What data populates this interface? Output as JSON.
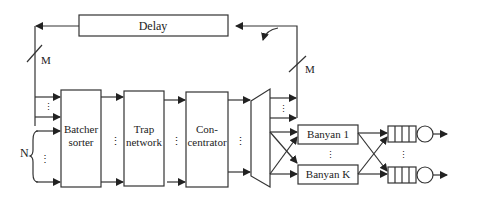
{
  "diagram": {
    "blocks": {
      "delay": "Delay",
      "batcher_line1": "Batcher",
      "batcher_line2": "sorter",
      "trap_line1": "Trap",
      "trap_line2": "network",
      "concentrator_line1": "Con-",
      "concentrator_line2": "centrator",
      "banyan_first": "Banyan 1",
      "banyan_last": "Banyan K"
    },
    "labels": {
      "feedback_width_left": "M",
      "feedback_width_right": "M",
      "inputs": "N"
    }
  }
}
